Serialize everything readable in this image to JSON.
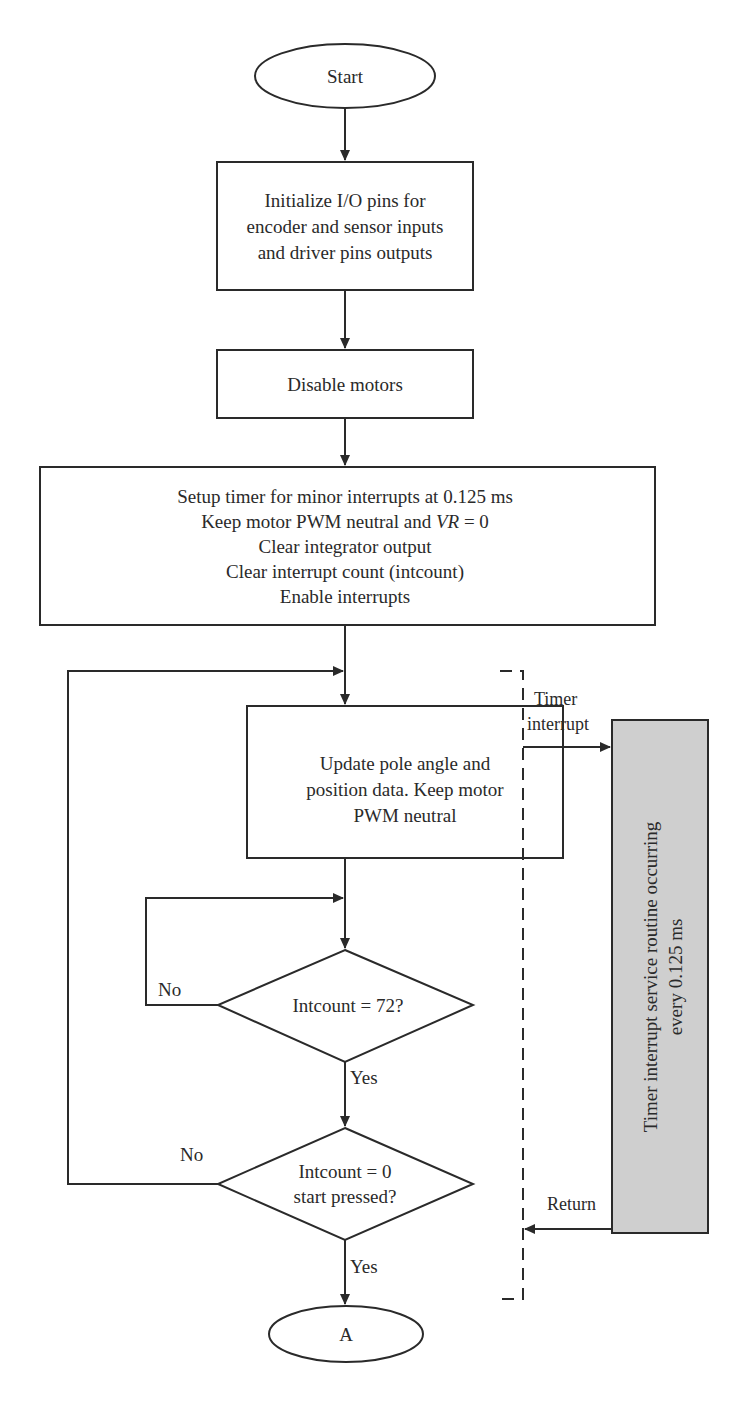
{
  "flowchart": {
    "start": {
      "label": "Start"
    },
    "init_io": {
      "lines": [
        "Initialize I/O pins for",
        "encoder and sensor inputs",
        "and driver pins outputs"
      ]
    },
    "disable_motors": {
      "label": "Disable motors"
    },
    "setup": {
      "lines": [
        "Setup timer for minor interrupts at 0.125 ms",
        "Keep motor PWM neutral and ",
        "Clear integrator output",
        "Clear interrupt count (intcount)",
        "Enable interrupts"
      ],
      "vr_italic": "VR",
      "vr_suffix": " = 0"
    },
    "update": {
      "lines": [
        "Update pole angle and",
        "position data. Keep motor",
        "PWM neutral"
      ]
    },
    "decision1": {
      "label": "Intcount = 72?",
      "no": "No",
      "yes": "Yes"
    },
    "decision2": {
      "lines": [
        "Intcount = 0",
        "start pressed?"
      ],
      "no": "No",
      "yes": "Yes"
    },
    "end": {
      "label": "A"
    },
    "timer_interrupt": {
      "lines": [
        "Timer",
        "interrupt"
      ]
    },
    "return": {
      "label": "Return"
    },
    "isr": {
      "lines": [
        "Timer interrupt service routine occurring",
        "every 0.125 ms"
      ],
      "fill_color": "#cfcfcf"
    }
  }
}
